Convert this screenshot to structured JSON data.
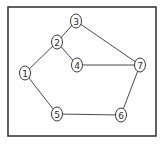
{
  "diagram": {
    "type": "undirected-graph",
    "frame": {
      "x": 8,
      "y": 7,
      "width": 148,
      "height": 129
    },
    "nodes": [
      {
        "id": "1",
        "label": "1",
        "x": 25,
        "y": 73
      },
      {
        "id": "2",
        "label": "2",
        "x": 57,
        "y": 42
      },
      {
        "id": "3",
        "label": "3",
        "x": 76,
        "y": 21
      },
      {
        "id": "4",
        "label": "4",
        "x": 77,
        "y": 65
      },
      {
        "id": "5",
        "label": "5",
        "x": 57,
        "y": 114
      },
      {
        "id": "6",
        "label": "6",
        "x": 121,
        "y": 115
      },
      {
        "id": "7",
        "label": "7",
        "x": 140,
        "y": 65
      }
    ],
    "edges": [
      {
        "from": "1",
        "to": "2"
      },
      {
        "from": "2",
        "to": "3"
      },
      {
        "from": "2",
        "to": "4"
      },
      {
        "from": "3",
        "to": "7"
      },
      {
        "from": "4",
        "to": "7"
      },
      {
        "from": "1",
        "to": "5"
      },
      {
        "from": "5",
        "to": "6"
      },
      {
        "from": "6",
        "to": "7"
      }
    ],
    "node_radius_x": 5.5,
    "node_radius_y": 7,
    "colors": {
      "stroke": "#3a3a3a",
      "edge": "#4a4a4a",
      "background": "#ffffff"
    }
  }
}
